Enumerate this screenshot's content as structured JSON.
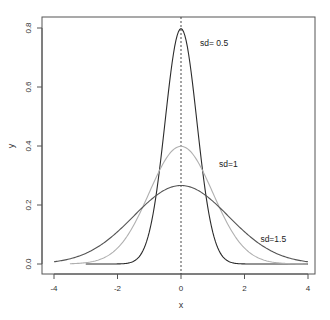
{
  "chart_data": {
    "type": "line",
    "title": "",
    "xlabel": "x",
    "ylabel": "y",
    "xlim": [
      -4,
      4
    ],
    "ylim": [
      0,
      0.8
    ],
    "xticks": [
      -4,
      -2,
      0,
      2,
      4
    ],
    "xtick_labels": [
      "-4",
      "-2",
      "0",
      "2",
      "4"
    ],
    "yticks": [
      0.0,
      0.2,
      0.4,
      0.6,
      0.8
    ],
    "ytick_labels": [
      "0.0",
      "0.2",
      "0.4",
      "0.6",
      "0.8"
    ],
    "grid": false,
    "legend": "none (inline annotations)",
    "vline": {
      "x": 0,
      "style": "dashed",
      "color": "#333333"
    },
    "x": [
      -4,
      -3.5,
      -3,
      -2.5,
      -2,
      -1.5,
      -1,
      -0.5,
      0,
      0.5,
      1,
      1.5,
      2,
      2.5,
      3,
      3.5,
      4
    ],
    "series": [
      {
        "name": "sd=0.5",
        "mean": 0,
        "sd": 0.5,
        "color": "#2b2b2b",
        "x_range": [
          -3,
          4
        ],
        "values": [
          0.0,
          0.0,
          0.0,
          0.0,
          0.0003,
          0.0089,
          0.108,
          0.4839,
          0.7979,
          0.4839,
          0.108,
          0.0089,
          0.0003,
          0.0,
          0.0,
          0.0,
          0.0
        ]
      },
      {
        "name": "sd=1",
        "mean": 0,
        "sd": 1,
        "color": "#b0b0b0",
        "x_range": [
          -3.5,
          4
        ],
        "values": [
          0.0001,
          0.0009,
          0.0044,
          0.0175,
          0.054,
          0.1295,
          0.242,
          0.3521,
          0.3989,
          0.3521,
          0.242,
          0.1295,
          0.054,
          0.0175,
          0.0044,
          0.0009,
          0.0001
        ]
      },
      {
        "name": "sd=1.5",
        "mean": 0,
        "sd": 1.5,
        "color": "#555555",
        "x_range": [
          -4,
          4
        ],
        "values": [
          0.0076,
          0.0174,
          0.036,
          0.0664,
          0.1093,
          0.1613,
          0.213,
          0.2516,
          0.266,
          0.2516,
          0.213,
          0.1613,
          0.1093,
          0.0664,
          0.036,
          0.0174,
          0.0076
        ]
      }
    ],
    "annotations": [
      {
        "text": "sd= 0.5",
        "x": 0.6,
        "y": 0.74
      },
      {
        "text": "sd=1",
        "x": 1.2,
        "y": 0.33
      },
      {
        "text": "sd=1.5",
        "x": 2.5,
        "y": 0.075
      }
    ]
  },
  "axes": {
    "xlabel": "x",
    "ylabel": "y"
  }
}
